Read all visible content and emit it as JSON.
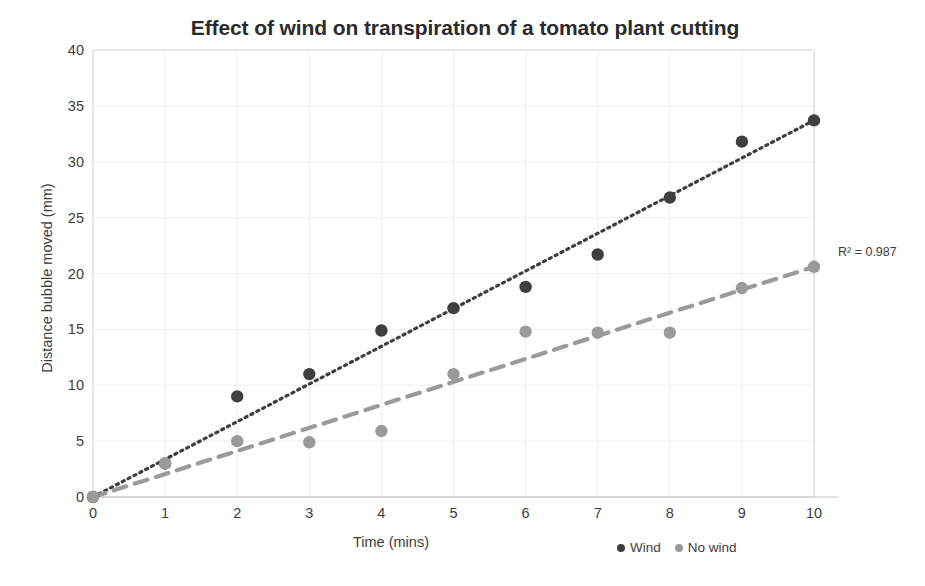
{
  "chart_data": {
    "type": "scatter",
    "title": "Effect of wind on transpiration of a tomato plant cutting",
    "xlabel": "Time (mins)",
    "ylabel": "Distance bubble moved (mm)",
    "xlim": [
      0,
      10
    ],
    "ylim": [
      0,
      40
    ],
    "xticks": [
      "0",
      "1",
      "2",
      "3",
      "4",
      "5",
      "6",
      "7",
      "8",
      "9",
      "10"
    ],
    "yticks": [
      "0",
      "5",
      "10",
      "15",
      "20",
      "25",
      "30",
      "35",
      "40"
    ],
    "grid": true,
    "legend_position": "bottom-right",
    "x": [
      0,
      1,
      2,
      3,
      4,
      5,
      6,
      7,
      8,
      9,
      10
    ],
    "series": [
      {
        "name": "Wind",
        "color": "#3f3f3f",
        "marker": "circle",
        "values": [
          0,
          3.0,
          9.0,
          11.0,
          14.9,
          16.9,
          18.8,
          21.7,
          26.8,
          31.8,
          33.7
        ],
        "trendline": {
          "style": "dotted",
          "color": "#3f3f3f",
          "intercept": -0.8,
          "slope": 3.45
        }
      },
      {
        "name": "No wind",
        "color": "#9a9a9a",
        "marker": "circle",
        "values": [
          0,
          3.0,
          5.0,
          4.9,
          5.9,
          11.0,
          14.8,
          14.7,
          14.7,
          18.7,
          20.6
        ],
        "trendline": {
          "style": "dashed",
          "color": "#9a9a9a",
          "intercept": -0.3,
          "slope": 2.09
        }
      }
    ],
    "annotations": [
      {
        "text": "R² = 0.987",
        "x": 10.4,
        "y": 22.0
      }
    ]
  },
  "legend": {
    "items": [
      {
        "label": "Wind",
        "color": "#3f3f3f"
      },
      {
        "label": "No wind",
        "color": "#9a9a9a"
      }
    ]
  },
  "colors": {
    "wind": "#3f3f3f",
    "no_wind": "#9a9a9a",
    "grid": "#ededed",
    "axis": "#d9d9d9",
    "text": "#3d3d3d"
  }
}
